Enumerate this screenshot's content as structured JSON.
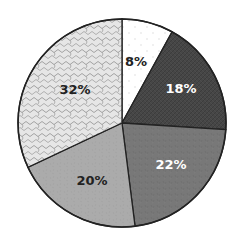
{
  "chart_data": {
    "type": "pie",
    "title": "",
    "start_angle_deg": 0,
    "direction": "clockwise",
    "center": [
      122,
      123
    ],
    "radius": 104,
    "slices": [
      {
        "label": "8%",
        "value": 8,
        "fill": "#ffffff",
        "pattern": "dots",
        "text_color": "#222222",
        "label_pos": [
          136,
          66
        ]
      },
      {
        "label": "18%",
        "value": 18,
        "fill": "#464646",
        "pattern": "crosshatch",
        "text_color": "#ffffff",
        "label_pos": [
          181,
          93
        ]
      },
      {
        "label": "22%",
        "value": 22,
        "fill": "#787878",
        "pattern": "noise",
        "text_color": "#ffffff",
        "label_pos": [
          171,
          169
        ]
      },
      {
        "label": "20%",
        "value": 20,
        "fill": "#ababab",
        "pattern": "noise",
        "text_color": "#222222",
        "label_pos": [
          92,
          185
        ]
      },
      {
        "label": "32%",
        "value": 32,
        "fill": "#e6e6e6",
        "pattern": "waves",
        "text_color": "#222222",
        "label_pos": [
          75,
          94
        ]
      }
    ],
    "legend": null,
    "outline_color": "#222222"
  }
}
